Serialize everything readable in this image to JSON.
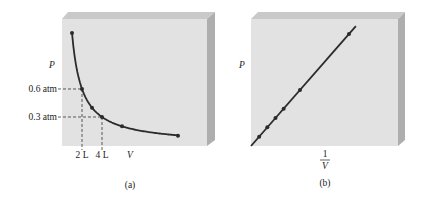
{
  "chart_data": [
    {
      "id": "a",
      "type": "line",
      "caption": "(a)",
      "xlabel": "V",
      "ylabel": "P",
      "x_ticks": [
        {
          "value": 2,
          "label": "2 L"
        },
        {
          "value": 4,
          "label": "4 L"
        }
      ],
      "y_ticks": [
        {
          "value": 0.6,
          "label": "0.6 atm"
        },
        {
          "value": 0.3,
          "label": "0.3 atm"
        }
      ],
      "guides": [
        {
          "x": 2,
          "y": 0.6
        },
        {
          "x": 4,
          "y": 0.3
        }
      ],
      "xlim": [
        0,
        14.5
      ],
      "ylim": [
        0,
        1.36
      ],
      "curve": "hyperbola",
      "constant_PV": 1.2,
      "curve_x_range": [
        1.0,
        11.6
      ],
      "points": [
        {
          "x": 1.0,
          "y": 1.2
        },
        {
          "x": 2.0,
          "y": 0.6
        },
        {
          "x": 3.0,
          "y": 0.4
        },
        {
          "x": 4.0,
          "y": 0.3
        },
        {
          "x": 6.0,
          "y": 0.2
        },
        {
          "x": 11.6,
          "y": 0.1
        }
      ],
      "grid": false
    },
    {
      "id": "b",
      "type": "line",
      "caption": "(b)",
      "xlabel_num": "1",
      "xlabel_den": "V",
      "ylabel": "P",
      "xlim": [
        0,
        1.5
      ],
      "ylim": [
        0,
        1.36
      ],
      "line_x_range": [
        0,
        1.07
      ],
      "points": [
        {
          "x": 0.0833,
          "y": 0.1
        },
        {
          "x": 0.1667,
          "y": 0.2
        },
        {
          "x": 0.25,
          "y": 0.3
        },
        {
          "x": 0.3333,
          "y": 0.4
        },
        {
          "x": 0.5,
          "y": 0.6
        },
        {
          "x": 1.0,
          "y": 1.2
        }
      ],
      "grid": false
    }
  ],
  "colors": {
    "panel_face": "#e2e2e2",
    "panel_top": "#c9c9c9",
    "panel_side": "#aeaeae",
    "line": "#2b2b2b"
  }
}
